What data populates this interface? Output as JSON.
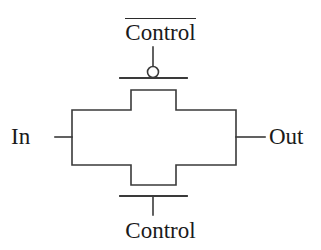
{
  "figure": {
    "background_color": "#ffffff",
    "line_color": "#3a3a3a",
    "text_color": "#1a1a1a",
    "width": 321,
    "height": 250
  },
  "labels": {
    "control_complement": "Control",
    "control_complement_has_overbar": true,
    "control": "Control",
    "input": "In",
    "output": "Out"
  },
  "icons": {
    "inversion_bubble": "inversion-bubble-icon",
    "pmos_gate": "pmos-gate-icon",
    "nmos_gate": "nmos-gate-icon",
    "transmission_body": "transmission-gate-body-icon"
  },
  "geometry": {
    "body_left": 72,
    "body_right": 236,
    "body_top": 110,
    "body_bottom": 165,
    "stem_left": 131,
    "stem_right": 176,
    "stem_top": 90,
    "stem_bottom": 185,
    "signal_y": 137,
    "in_lead_x1": 55,
    "in_lead_x2": 72,
    "out_lead_x1": 236,
    "out_lead_x2": 265,
    "top_gate_y": 78,
    "top_gate_x1": 120,
    "top_gate_x2": 187,
    "bottom_gate_y": 196,
    "bottom_gate_x1": 120,
    "bottom_gate_x2": 187,
    "bubble_cx": 153,
    "bubble_cy": 72,
    "bubble_r": 5.5,
    "top_stem_x": 153,
    "top_stem_y1": 47,
    "top_stem_y2": 66,
    "bottom_stem_x": 153,
    "bottom_stem_y1": 196,
    "bottom_stem_y2": 215
  }
}
